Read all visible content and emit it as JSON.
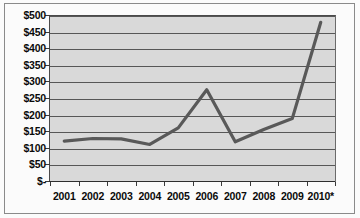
{
  "chart_data": {
    "type": "line",
    "title": "",
    "subtitle": "",
    "xlabel": "",
    "ylabel": "",
    "categories": [
      "2001",
      "2002",
      "2003",
      "2004",
      "2005",
      "2006",
      "2007",
      "2008",
      "2009",
      "2010*"
    ],
    "values": [
      120,
      128,
      127,
      110,
      160,
      275,
      118,
      155,
      188,
      478
    ],
    "series": [
      {
        "name": "",
        "values": [
          120,
          128,
          127,
          110,
          160,
          275,
          118,
          155,
          188,
          478
        ],
        "color": "#595959"
      }
    ],
    "ylim": [
      0,
      500
    ],
    "ytick_values": [
      0,
      50,
      100,
      150,
      200,
      250,
      300,
      350,
      400,
      450,
      500
    ],
    "ytick_labels": [
      "$-",
      "$50",
      "$100",
      "$150",
      "$200",
      "$250",
      "$300",
      "$350",
      "$400",
      "$450",
      "$500"
    ],
    "xtick_labels": [
      "2001",
      "2002",
      "2003",
      "2004",
      "2005",
      "2006",
      "2007",
      "2008",
      "2009",
      "2010*"
    ],
    "grid": true,
    "grid_axis": "y",
    "legend": false,
    "legend_position": "none",
    "annotations": [
      "2010*"
    ],
    "plot_background_color": "#d9d9d9",
    "gridline_color": "#575757",
    "line_color": "#595959",
    "text_color": "#0a0a0a",
    "page_background_color": "#fbfbfb",
    "border_color": "#8a8a8a"
  }
}
